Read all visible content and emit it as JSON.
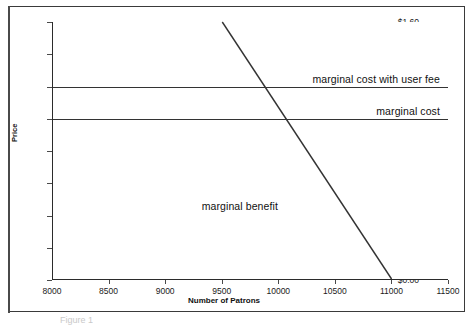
{
  "chart_data": {
    "type": "line",
    "title": "",
    "xlabel": "Number of Patrons",
    "ylabel": "Price",
    "xlim": [
      8000,
      11500
    ],
    "ylim": [
      0.0,
      1.6
    ],
    "xticks": [
      "8000",
      "8500",
      "9000",
      "9500",
      "10000",
      "10500",
      "11000",
      "11500"
    ],
    "xtick_values": [
      8000,
      8500,
      9000,
      9500,
      10000,
      10500,
      11000,
      11500
    ],
    "yticks": [
      "$0.00",
      "$0.20",
      "$0.40",
      "$0.60",
      "$0.80",
      "$1.00",
      "$1.20",
      "$1.40",
      "$1.60"
    ],
    "ytick_values": [
      0.0,
      0.2,
      0.4,
      0.6,
      0.8,
      1.0,
      1.2,
      1.4,
      1.6
    ],
    "grid": false,
    "legend_position": "inline-annotations",
    "series": [
      {
        "name": "marginal cost with user fee",
        "label": "marginal cost with user fee",
        "kind": "horizontal",
        "value": 1.2,
        "x": [
          8000,
          11500
        ],
        "values": [
          1.2,
          1.2
        ]
      },
      {
        "name": "marginal cost",
        "label": "marginal cost",
        "kind": "horizontal",
        "value": 1.0,
        "x": [
          8000,
          11500
        ],
        "values": [
          1.0,
          1.0
        ]
      },
      {
        "name": "marginal benefit",
        "label": "marginal benefit",
        "kind": "sloped",
        "x": [
          9500,
          11000
        ],
        "values": [
          1.6,
          0.0
        ]
      }
    ],
    "annotations": [
      {
        "text": "marginal cost with user fee",
        "x": 10500,
        "y": 1.26
      },
      {
        "text": "marginal cost",
        "x": 10800,
        "y": 1.06
      },
      {
        "text": "marginal benefit",
        "x": 9800,
        "y": 0.45
      }
    ],
    "intersections": [
      {
        "description": "marginal benefit meets marginal cost with user fee",
        "x": 9875,
        "y": 1.2
      },
      {
        "description": "marginal benefit meets marginal cost",
        "x": 10000,
        "y": 1.0
      }
    ],
    "colors": {
      "line": "#333333",
      "axis": "#2b2b2b",
      "text": "#111111",
      "background": "#ffffff"
    }
  },
  "caption": {
    "text": "Figure 1"
  }
}
